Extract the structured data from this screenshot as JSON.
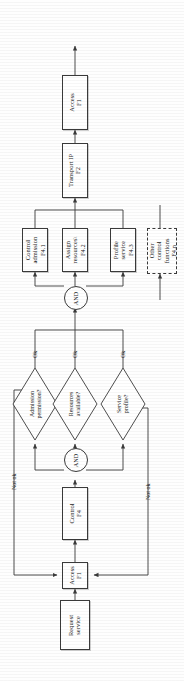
{
  "diagram": {
    "orientation": "rotated-90-ccw",
    "colors": {
      "stroke": "#3a3a3a",
      "text": "#1a1a1a",
      "background": "#ffffff"
    },
    "nodes": [
      {
        "id": "access_top",
        "type": "process",
        "lines": [
          "Access",
          "F1"
        ]
      },
      {
        "id": "transport",
        "type": "process",
        "lines": [
          "Transport IP",
          "F2"
        ]
      },
      {
        "id": "control_adm",
        "type": "process",
        "lines": [
          "Control",
          "admission",
          "F4.1"
        ]
      },
      {
        "id": "assign_res",
        "type": "process",
        "lines": [
          "Assign",
          "resources\\",
          "F4.2"
        ]
      },
      {
        "id": "profile_serv",
        "type": "process",
        "lines": [
          "Profile",
          "service",
          "F4.3"
        ]
      },
      {
        "id": "other_ctrl",
        "type": "process-dashed",
        "lines": [
          "Other",
          "control",
          "functions",
          "F4.n"
        ]
      },
      {
        "id": "admission_q",
        "type": "decision",
        "lines": [
          "Admission",
          "permission?"
        ]
      },
      {
        "id": "resources_q",
        "type": "decision",
        "lines": [
          "Resources",
          "available?"
        ]
      },
      {
        "id": "service_q",
        "type": "decision",
        "lines": [
          "Service",
          "profile?"
        ]
      },
      {
        "id": "control_f4",
        "type": "process",
        "lines": [
          "Control",
          "F4"
        ]
      },
      {
        "id": "access_bottom",
        "type": "process",
        "lines": [
          "Access",
          "F1"
        ]
      },
      {
        "id": "request",
        "type": "process",
        "lines": [
          "Request",
          "service"
        ]
      },
      {
        "id": "and_upper",
        "type": "gate",
        "lines": [
          "AND"
        ]
      },
      {
        "id": "and_lower",
        "type": "gate",
        "lines": [
          "AND"
        ]
      }
    ],
    "edge_labels": [
      {
        "id": "ok_1",
        "text": "Ok"
      },
      {
        "id": "ok_2",
        "text": "Ok"
      },
      {
        "id": "ok_3",
        "text": "Ok"
      },
      {
        "id": "notok_1",
        "text": "Not ok"
      },
      {
        "id": "notok_2",
        "text": "Not ok"
      }
    ]
  }
}
